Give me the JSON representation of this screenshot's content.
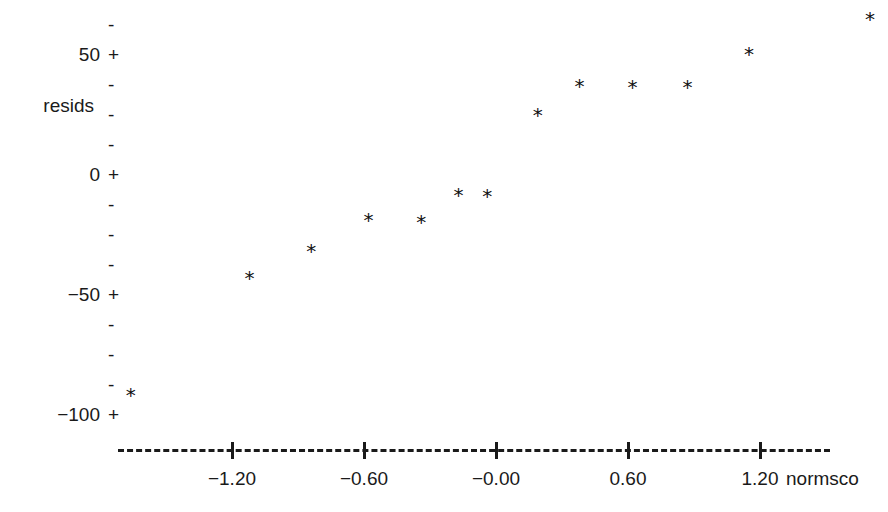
{
  "chart_data": {
    "type": "scatter",
    "title": "",
    "xlabel": "normsco",
    "ylabel": "resids",
    "marker": "*",
    "grid": false,
    "legend": null,
    "xlim": [
      -1.95,
      1.95
    ],
    "ylim": [
      -111,
      76
    ],
    "x_ticks": [
      {
        "value": -1.2,
        "label": "-1.20"
      },
      {
        "value": -0.6,
        "label": "-0.60"
      },
      {
        "value": 0.0,
        "label": "-0.00"
      },
      {
        "value": 0.6,
        "label": "0.60"
      },
      {
        "value": 1.2,
        "label": "1.20"
      }
    ],
    "y_ticks": [
      {
        "value": 50,
        "label": "50",
        "glyph": "+"
      },
      {
        "value": 0,
        "label": "0",
        "glyph": "+"
      },
      {
        "value": -50,
        "label": "-50",
        "glyph": "+"
      },
      {
        "value": -100,
        "label": "-100",
        "glyph": "+"
      }
    ],
    "y_minor_glyph": "-",
    "y_minor_values": [
      62.5,
      37.5,
      25,
      12.5,
      -12.5,
      -25,
      -37.5,
      -62.5,
      -75,
      -87.5
    ],
    "x": [
      -1.66,
      -1.12,
      -0.84,
      -0.58,
      -0.34,
      -0.17,
      -0.04,
      0.19,
      0.38,
      0.62,
      0.87,
      1.15,
      1.7
    ],
    "y": [
      -92.5,
      -43.8,
      -32.5,
      -19.6,
      -20.4,
      -9.2,
      -9.6,
      24.2,
      36.3,
      35.8,
      35.8,
      49.6,
      64.2
    ],
    "n_points": 13,
    "colors": {
      "ink": "#1a1a1a",
      "marker": "#111111",
      "background": "#ffffff"
    }
  }
}
